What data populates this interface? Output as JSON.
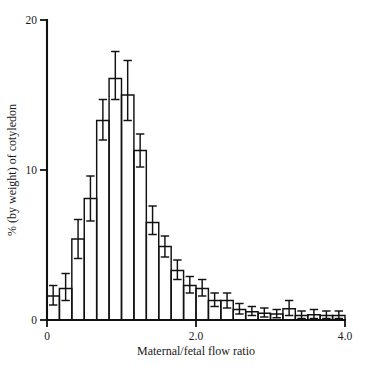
{
  "chart_data": {
    "type": "bar",
    "title": "",
    "subtitle": "",
    "xlabel": "Maternal/fetal flow ratio",
    "ylabel": "% (by weight) of cotyledon",
    "xlim": [
      0,
      4.0
    ],
    "ylim": [
      0,
      20
    ],
    "grid": false,
    "legend": null,
    "bin_width": 0.1667,
    "x_ticks": [
      {
        "value": 0,
        "label": "0"
      },
      {
        "value": 2.0,
        "label": "2.0"
      },
      {
        "value": 4.0,
        "label": "4.0"
      }
    ],
    "y_ticks": [
      {
        "value": 0,
        "label": "0"
      },
      {
        "value": 10,
        "label": "10"
      },
      {
        "value": 20,
        "label": "20"
      }
    ],
    "error_bar_style": "vertical-with-caps",
    "bins": [
      {
        "x_left": 0.0,
        "x_right": 0.1667,
        "x_center": 0.083,
        "value": 1.6,
        "err_low": 1.0,
        "err_high": 2.3
      },
      {
        "x_left": 0.1667,
        "x_right": 0.3333,
        "x_center": 0.25,
        "value": 2.1,
        "err_low": 1.3,
        "err_high": 3.1
      },
      {
        "x_left": 0.3333,
        "x_right": 0.5,
        "x_center": 0.417,
        "value": 5.4,
        "err_low": 4.1,
        "err_high": 6.7
      },
      {
        "x_left": 0.5,
        "x_right": 0.6667,
        "x_center": 0.583,
        "value": 8.1,
        "err_low": 6.6,
        "err_high": 9.6
      },
      {
        "x_left": 0.6667,
        "x_right": 0.8333,
        "x_center": 0.75,
        "value": 13.3,
        "err_low": 12.0,
        "err_high": 14.7
      },
      {
        "x_left": 0.8333,
        "x_right": 1.0,
        "x_center": 0.917,
        "value": 16.1,
        "err_low": 14.7,
        "err_high": 17.9
      },
      {
        "x_left": 1.0,
        "x_right": 1.1667,
        "x_center": 1.083,
        "value": 15.0,
        "err_low": 13.3,
        "err_high": 17.3
      },
      {
        "x_left": 1.1667,
        "x_right": 1.3333,
        "x_center": 1.25,
        "value": 11.3,
        "err_low": 10.2,
        "err_high": 12.4
      },
      {
        "x_left": 1.3333,
        "x_right": 1.5,
        "x_center": 1.417,
        "value": 6.5,
        "err_low": 5.7,
        "err_high": 7.6
      },
      {
        "x_left": 1.5,
        "x_right": 1.6667,
        "x_center": 1.583,
        "value": 4.9,
        "err_low": 4.2,
        "err_high": 5.6
      },
      {
        "x_left": 1.6667,
        "x_right": 1.8333,
        "x_center": 1.75,
        "value": 3.3,
        "err_low": 2.7,
        "err_high": 4.0
      },
      {
        "x_left": 1.8333,
        "x_right": 2.0,
        "x_center": 1.917,
        "value": 2.3,
        "err_low": 1.8,
        "err_high": 2.9
      },
      {
        "x_left": 2.0,
        "x_right": 2.1667,
        "x_center": 2.083,
        "value": 2.1,
        "err_low": 1.6,
        "err_high": 2.7
      },
      {
        "x_left": 2.1667,
        "x_right": 2.3333,
        "x_center": 2.25,
        "value": 1.3,
        "err_low": 0.9,
        "err_high": 1.8
      },
      {
        "x_left": 2.3333,
        "x_right": 2.5,
        "x_center": 2.417,
        "value": 1.3,
        "err_low": 0.8,
        "err_high": 1.8
      },
      {
        "x_left": 2.5,
        "x_right": 2.6667,
        "x_center": 2.583,
        "value": 0.7,
        "err_low": 0.4,
        "err_high": 1.1
      },
      {
        "x_left": 2.6667,
        "x_right": 2.8333,
        "x_center": 2.75,
        "value": 0.55,
        "err_low": 0.3,
        "err_high": 0.9
      },
      {
        "x_left": 2.8333,
        "x_right": 3.0,
        "x_center": 2.917,
        "value": 0.45,
        "err_low": 0.2,
        "err_high": 0.8
      },
      {
        "x_left": 3.0,
        "x_right": 3.1667,
        "x_center": 3.083,
        "value": 0.4,
        "err_low": 0.15,
        "err_high": 0.7
      },
      {
        "x_left": 3.1667,
        "x_right": 3.3333,
        "x_center": 3.25,
        "value": 0.75,
        "err_low": 0.3,
        "err_high": 1.3
      },
      {
        "x_left": 3.3333,
        "x_right": 3.5,
        "x_center": 3.417,
        "value": 0.3,
        "err_low": 0.1,
        "err_high": 0.6
      },
      {
        "x_left": 3.5,
        "x_right": 3.6667,
        "x_center": 3.583,
        "value": 0.35,
        "err_low": 0.1,
        "err_high": 0.7
      },
      {
        "x_left": 3.6667,
        "x_right": 3.8333,
        "x_center": 3.75,
        "value": 0.3,
        "err_low": 0.1,
        "err_high": 0.6
      },
      {
        "x_left": 3.8333,
        "x_right": 4.0,
        "x_center": 3.917,
        "value": 0.3,
        "err_low": 0.1,
        "err_high": 0.6
      }
    ]
  },
  "plot_geometry": {
    "left_px": 47,
    "right_px": 345,
    "baseline_px": 320,
    "top_px": 20
  }
}
